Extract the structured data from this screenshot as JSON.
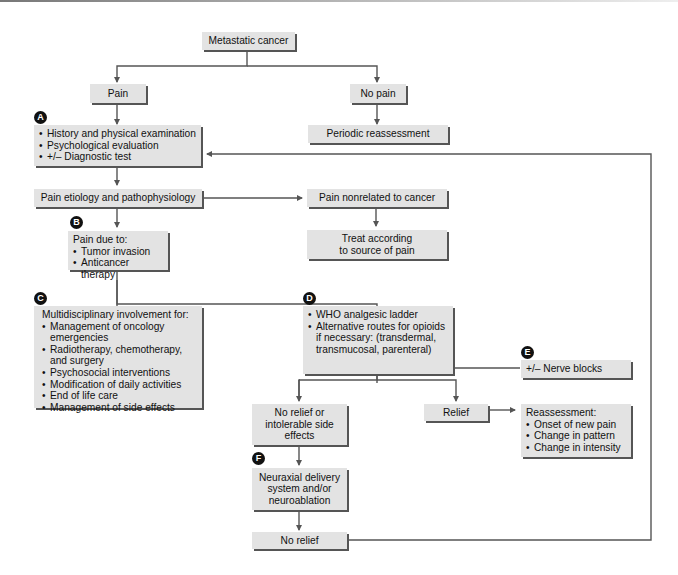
{
  "diagram": {
    "nodes": {
      "metastatic_cancer": "Metastatic cancer",
      "pain": "Pain",
      "no_pain": "No pain",
      "periodic_reassessment": "Periodic reassessment",
      "assessment": {
        "items": [
          "History and physical examination",
          "Psychological evaluation",
          "+/– Diagnostic test"
        ]
      },
      "etiology": "Pain etiology and pathophysiology",
      "nonrelated": "Pain nonrelated to cancer",
      "treat_source": {
        "line1": "Treat according",
        "line2": "to source of pain"
      },
      "pain_due": {
        "heading": "Pain due to:",
        "items": [
          "Tumor invasion",
          "Anticancer therapy"
        ]
      },
      "multidisciplinary": {
        "heading": "Multidisciplinary involvement for:",
        "items": [
          "Management of oncology emergencies",
          "Radiotherapy, chemotherapy, and surgery",
          "Psychosocial interventions",
          "Modification of daily activities",
          "End of life care",
          "Management of side effects"
        ]
      },
      "who_ladder": {
        "items": [
          "WHO analgesic ladder",
          "Alternative routes for opioids if necessary: (transdermal, transmucosal, parenteral)"
        ]
      },
      "nerve_blocks": "+/– Nerve blocks",
      "no_relief_side": {
        "line1": "No relief or",
        "line2": "intolerable side",
        "line3": "effects"
      },
      "relief": "Relief",
      "reassessment": {
        "heading": "Reassessment:",
        "items": [
          "Onset of new pain",
          "Change in pattern",
          "Change in intensity"
        ]
      },
      "neuraxial": {
        "line1": "Neuraxial delivery",
        "line2": "system and/or",
        "line3": "neuroablation"
      },
      "no_relief": "No relief"
    },
    "badges": {
      "a": "A",
      "b": "B",
      "c": "C",
      "d": "D",
      "e": "E",
      "f": "F"
    },
    "colors": {
      "box_fill": "#e3e3e3",
      "box_shadow": "#555555",
      "line": "#555555",
      "badge": "#111111"
    }
  }
}
